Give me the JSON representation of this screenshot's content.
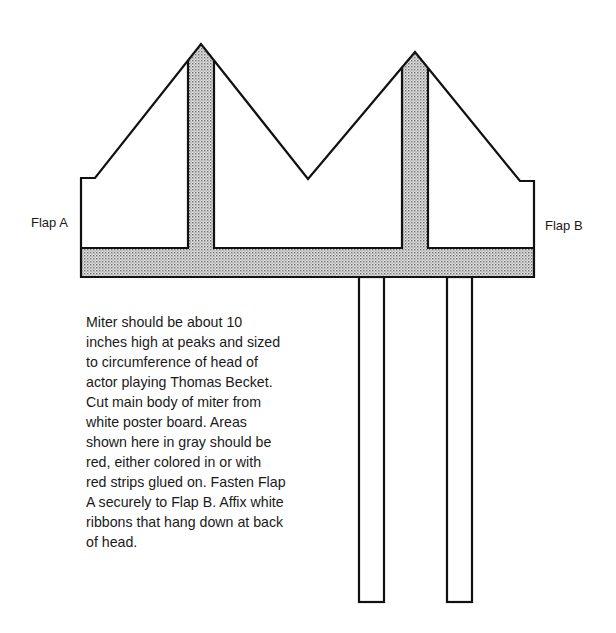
{
  "diagram": {
    "labels": {
      "flap_a": "Flap A",
      "flap_b": "Flap B"
    },
    "colors": {
      "outline": "#111111",
      "shaded": "#c8c8c8",
      "background": "#ffffff"
    },
    "instructions": {
      "lines": [
        "Miter should be about 10",
        "inches high at peaks and sized",
        "to circumference of head of",
        "actor playing Thomas Becket.",
        "Cut main body of miter from",
        "white poster board. Areas",
        "shown here in gray should be",
        "red, either colored in or with",
        "red strips glued on. Fasten Flap",
        "A securely to Flap B. Affix white",
        "ribbons that hang down at back",
        "of head."
      ]
    }
  }
}
